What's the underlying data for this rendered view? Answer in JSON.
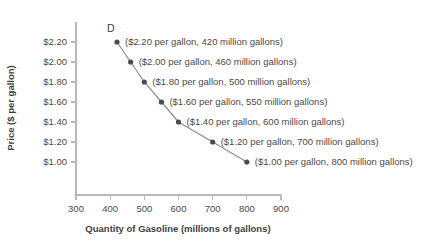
{
  "chart_data": {
    "type": "line",
    "title": "",
    "xlabel": "Quantity of Gasoline (millions of gallons)",
    "ylabel": "Price ($ per gallon)",
    "xlim": [
      300,
      900
    ],
    "ylim": [
      1.0,
      2.2
    ],
    "xticks": [
      300,
      400,
      500,
      600,
      700,
      800,
      900
    ],
    "xtick_labels": [
      "300",
      "400",
      "500",
      "600",
      "700",
      "800",
      "900"
    ],
    "yticks": [
      1.0,
      1.2,
      1.4,
      1.6,
      1.8,
      2.0,
      2.2
    ],
    "ytick_labels": [
      "$1.00",
      "$1.20",
      "$1.40",
      "$1.60",
      "$1.80",
      "$2.00",
      "$2.20"
    ],
    "grid": false,
    "legend": "none",
    "series": [
      {
        "name": "D",
        "x": [
          420,
          460,
          500,
          550,
          600,
          700,
          800
        ],
        "y": [
          2.2,
          2.0,
          1.8,
          1.6,
          1.4,
          1.2,
          1.0
        ],
        "point_labels": [
          "($2.20 per gallon, 420 million gallons)",
          "($2.00 per gallon, 460 million gallons)",
          "($1.80 per gallon, 500 million gallons)",
          "($1.60 per gallon, 550 million gallons)",
          "($1.40 per gallon, 600 million gallons)",
          "($1.20 per gallon, 700 million gallons)",
          "($1.00 per gallon, 800 million gallons)"
        ]
      }
    ]
  }
}
